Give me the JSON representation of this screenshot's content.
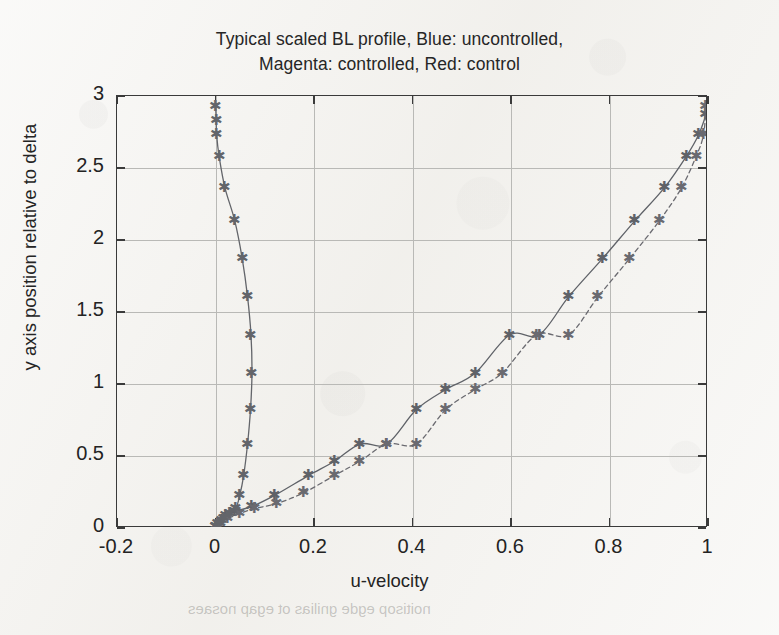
{
  "figure": {
    "title_line1": "Typical scaled BL profile, Blue: uncontrolled,",
    "title_line2": "Magenta: controlled, Red: control",
    "xlabel": "u-velocity",
    "ylabel": "y axis position relative to delta",
    "bleed_through_text": "noitisop egde gnilias ot egap nosaes"
  },
  "chart_data": {
    "type": "line",
    "title": "Typical scaled BL profile, Blue: uncontrolled, Magenta: controlled, Red: control",
    "xlabel": "u-velocity",
    "ylabel": "y axis position relative to delta",
    "xlim": [
      -0.2,
      1.0
    ],
    "ylim": [
      0,
      3
    ],
    "xticks": [
      -0.2,
      0,
      0.2,
      0.4,
      0.6,
      0.8,
      1
    ],
    "yticks": [
      0,
      0.5,
      1,
      1.5,
      2,
      2.5,
      3
    ],
    "xtick_labels": [
      "-0.2",
      "0",
      "0.2",
      "0.4",
      "0.6",
      "0.8",
      "1"
    ],
    "ytick_labels": [
      "0",
      "0.5",
      "1",
      "1.5",
      "2",
      "2.5",
      "3"
    ],
    "grid": true,
    "legend": "none (described in title)",
    "marker": "asterisk",
    "series": [
      {
        "name": "uncontrolled",
        "color_name": "Blue",
        "color": "#5f6268",
        "linestyle": "solid",
        "marker": "*",
        "points": [
          [
            0.0,
            0.0
          ],
          [
            0.005,
            0.02
          ],
          [
            0.012,
            0.045
          ],
          [
            0.022,
            0.075
          ],
          [
            0.04,
            0.105
          ],
          [
            0.075,
            0.14
          ],
          [
            0.12,
            0.215
          ],
          [
            0.19,
            0.355
          ],
          [
            0.243,
            0.455
          ],
          [
            0.295,
            0.575
          ],
          [
            0.35,
            0.575
          ],
          [
            0.41,
            0.815
          ],
          [
            0.47,
            0.955
          ],
          [
            0.53,
            1.07
          ],
          [
            0.6,
            1.335
          ],
          [
            0.66,
            1.335
          ],
          [
            0.72,
            1.6
          ],
          [
            0.79,
            1.87
          ],
          [
            0.855,
            2.13
          ],
          [
            0.915,
            2.36
          ],
          [
            0.96,
            2.58
          ],
          [
            0.985,
            2.73
          ],
          [
            1.0,
            2.87
          ]
        ]
      },
      {
        "name": "controlled",
        "color_name": "Magenta",
        "color": "#6a6a70",
        "linestyle": "dashed",
        "marker": "*",
        "points": [
          [
            0.0,
            0.0
          ],
          [
            0.01,
            0.025
          ],
          [
            0.025,
            0.055
          ],
          [
            0.05,
            0.09
          ],
          [
            0.08,
            0.125
          ],
          [
            0.125,
            0.16
          ],
          [
            0.18,
            0.235
          ],
          [
            0.243,
            0.355
          ],
          [
            0.295,
            0.455
          ],
          [
            0.35,
            0.575
          ],
          [
            0.41,
            0.575
          ],
          [
            0.47,
            0.815
          ],
          [
            0.53,
            0.955
          ],
          [
            0.585,
            1.07
          ],
          [
            0.655,
            1.335
          ],
          [
            0.72,
            1.335
          ],
          [
            0.78,
            1.6
          ],
          [
            0.845,
            1.87
          ],
          [
            0.905,
            2.13
          ],
          [
            0.95,
            2.36
          ],
          [
            0.98,
            2.58
          ],
          [
            0.995,
            2.73
          ],
          [
            1.0,
            2.93
          ]
        ]
      },
      {
        "name": "control",
        "color_name": "Red",
        "color": "#63656a",
        "linestyle": "solid",
        "marker": "*",
        "points": [
          [
            0.0,
            0.0
          ],
          [
            0.008,
            0.025
          ],
          [
            0.018,
            0.055
          ],
          [
            0.03,
            0.09
          ],
          [
            0.042,
            0.125
          ],
          [
            0.05,
            0.215
          ],
          [
            0.058,
            0.355
          ],
          [
            0.066,
            0.575
          ],
          [
            0.072,
            0.815
          ],
          [
            0.075,
            1.07
          ],
          [
            0.073,
            1.335
          ],
          [
            0.066,
            1.6
          ],
          [
            0.055,
            1.87
          ],
          [
            0.04,
            2.13
          ],
          [
            0.02,
            2.36
          ],
          [
            0.008,
            2.58
          ],
          [
            0.003,
            2.73
          ],
          [
            0.002,
            2.83
          ],
          [
            0.001,
            2.93
          ]
        ]
      }
    ]
  }
}
